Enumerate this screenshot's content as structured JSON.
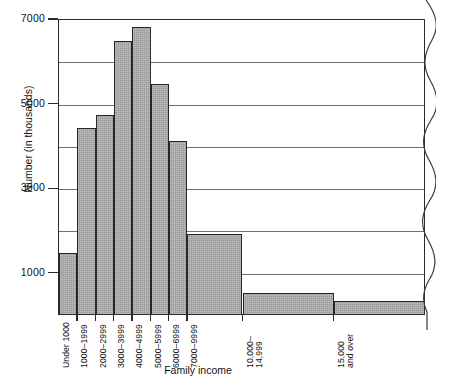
{
  "chart_data": {
    "type": "bar",
    "title": "",
    "subtitle": "",
    "xlabel": "Family income",
    "ylabel": "Number (in thousands)",
    "categories": [
      "Under 1000",
      "1000–1999",
      "2000–2999",
      "3000–3999",
      "4000–4999",
      "5000–5999",
      "6000–6999",
      "7000–9999",
      "10,000–14,999",
      "15,000 and over"
    ],
    "category_lines": [
      [
        "Under 1000"
      ],
      [
        "1000–1999"
      ],
      [
        "2000–2999"
      ],
      [
        "3000–3999"
      ],
      [
        "4000–4999"
      ],
      [
        "5000–5999"
      ],
      [
        "6000–6999"
      ],
      [
        "7000–9999"
      ],
      [
        "10,000–",
        "14,999"
      ],
      [
        "15,000",
        "and over"
      ]
    ],
    "values": [
      1450,
      4400,
      4700,
      6450,
      6800,
      5450,
      4100,
      1900,
      500,
      300
    ],
    "bin_widths": [
      1,
      1,
      1,
      1,
      1,
      1,
      1,
      3,
      5,
      5
    ],
    "ylim": [
      0,
      7000
    ],
    "yticks": [
      1000,
      3000,
      5000,
      7000
    ],
    "ytick_labels": [
      "1000",
      "3000",
      "5000",
      "7000"
    ],
    "gridlines": [
      1000,
      2000,
      3000,
      4000,
      5000,
      6000,
      7000
    ],
    "grid": true,
    "legend": null,
    "legend_position": "none",
    "bar_fill_color": "#9c9c9c",
    "bar_edge_color": "#262626",
    "axis_color": "#2b2b2b",
    "grid_color": "#6f6f6f",
    "background_color": "#ffffff"
  },
  "figure": {
    "torn_edge_label": "torn-page-edge"
  }
}
